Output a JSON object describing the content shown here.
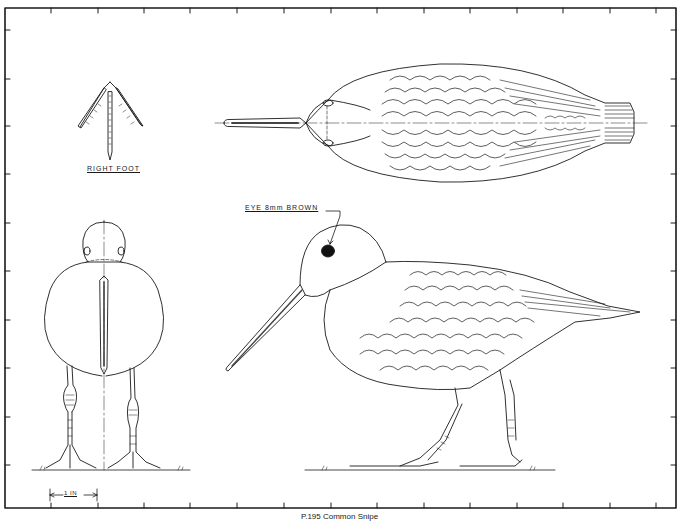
{
  "drawing": {
    "subject": "Common Snipe",
    "views": [
      "top-view",
      "side-view",
      "front-view",
      "right-foot-detail"
    ],
    "labels": {
      "right_foot": "RIGHT FOOT",
      "eye_note": "EYE  8mm BROWN",
      "scale": "1 IN"
    },
    "caption": "P.195 Common Snipe"
  },
  "colors": {
    "line": "#1a1a1a",
    "paper": "#ffffff",
    "eye": "#111111"
  }
}
